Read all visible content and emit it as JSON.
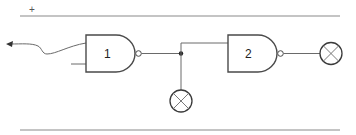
{
  "diagram": {
    "type": "logic-circuit",
    "rails": {
      "top_label": "+",
      "top": {
        "x1": 20,
        "x2": 340,
        "y": 16
      },
      "bottom": {
        "x1": 20,
        "x2": 340,
        "y": 130
      }
    },
    "gates": [
      {
        "id": "gate-1",
        "label": "1",
        "kind": "NAND"
      },
      {
        "id": "gate-2",
        "label": "2",
        "kind": "NAND"
      }
    ],
    "lamps": [
      {
        "id": "lamp-junction",
        "position": "below junction"
      },
      {
        "id": "lamp-output",
        "position": "gate 2 output"
      }
    ],
    "colors": {
      "line": "#6a6a6a",
      "gate_stroke": "#4a4a4a",
      "background": "#ffffff"
    }
  }
}
